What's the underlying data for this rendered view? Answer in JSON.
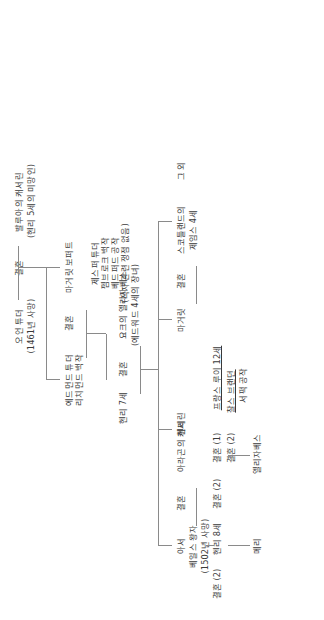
{
  "diagram": {
    "type": "family-tree",
    "orientation": "rotated-90",
    "line_color": "#8a8a8a",
    "text_color": "#3a3a3a"
  },
  "nodes": {
    "owen_tudor": {
      "name": "오언 튜더",
      "detail": "(1461년 사망)"
    },
    "marriage_owen": {
      "label": "결혼"
    },
    "catherine_valois": {
      "name": "발루아의 캐서린",
      "detail": "(헨리 5세의 미망인)"
    },
    "edmund_tudor": {
      "line1": "에드먼드 튜더",
      "line2": "리치먼드 백작"
    },
    "marriage_edmund": {
      "label": "결혼"
    },
    "margaret_beaufort": {
      "name": "마거릿 보퍼트"
    },
    "jasper_tudor": {
      "line1": "제스퍼 튜더",
      "line2": "펨브로크 백작",
      "line3": "베드퍼드 공작",
      "line4": "(적자 관련 쟁점 없음)"
    },
    "henry_vii": {
      "name": "헨리 7세"
    },
    "marriage_henry_vii": {
      "label": "결혼"
    },
    "elizabeth_york": {
      "line1": "요크의 엘리자베스",
      "line2": "(에드워드 4세의 장녀)"
    },
    "arthur": {
      "name": "아서"
    },
    "marriage_arthur": {
      "label": "결혼"
    },
    "catherine_aragon_1": {
      "name": "베일스 왕자",
      "detail": "(1502년 사망)"
    },
    "catherine_aragon_2": {
      "name": "아라곤의 캐서린"
    },
    "henry_viii_marr_2a": {
      "label": "결혼 (2)"
    },
    "henry_viii_label": {
      "name": "헨리 8세"
    },
    "henry_viii_marr_2b": {
      "label": "결혼 (2)"
    },
    "anne_boleyn": {
      "name": "앤 불린"
    },
    "henry_child": {
      "name": "헨리"
    },
    "elizabeth_i": {
      "name": "엘리자베스"
    },
    "mary_label": {
      "name": "메리"
    },
    "mary_marr_1": {
      "label": "결혼 (1)"
    },
    "louis_xii": {
      "name": "프랑스 루이 12세"
    },
    "mary_marr_2": {
      "label": "결혼 (2)"
    },
    "charles_brandon": {
      "line1": "찰스 브랜던",
      "line2": "서퍽 공작"
    },
    "margaret_tudor": {
      "name": "마거릿"
    },
    "marriage_margaret": {
      "label": "결혼"
    },
    "james_iv": {
      "line1": "스코틀랜드의",
      "line2": "제임스 4세"
    },
    "others": {
      "name": "그 외"
    }
  }
}
